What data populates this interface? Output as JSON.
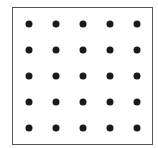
{
  "diagram": {
    "type": "dot-grid",
    "rows": 5,
    "columns": 5,
    "dot_count": 25,
    "border_color": "#555555",
    "dot_color": "#1a1a1a",
    "column_x": [
      29,
      56,
      83,
      110,
      137
    ],
    "row_y": [
      24,
      50,
      76,
      102,
      128
    ]
  }
}
